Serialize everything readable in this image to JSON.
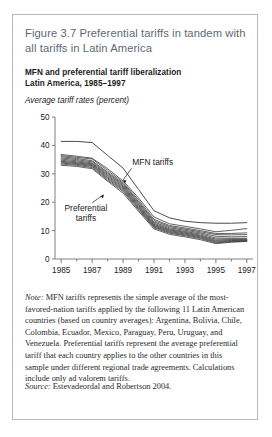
{
  "figure": {
    "number": "Figure 3.7",
    "title": "Preferential tariffs in tandem with all tariffs in Latin America",
    "subtitle_line1": "MFN and preferential tariff liberalization",
    "subtitle_line2": "Latin America, 1985–1997",
    "note_label": "Note:",
    "note_text": " MFN tariffs represents the simple average of the most-favored-nation tariffs applied by the following 11 Latin American countries (based on country averages): Argentina, Bolivia, Chile, Colombia, Ecuador, Mexico, Paraguay, Peru, Uruguay, and Venezuela. Preferential tariffs represent the average preferential tariff that each country applies to the other countries in this sample under different regional trade agreements. Calculations include only ad valorem tariffs.",
    "source_label": "Source:",
    "source_text": " Estevadeordal and Robertson 2004.",
    "border_color": "#b9b9b9",
    "title_color": "#5d6a72"
  },
  "chart_data": {
    "type": "line",
    "title": "MFN and preferential tariff liberalization Latin America, 1985–1997",
    "xlabel": "",
    "ylabel": "Average tariff rates (percent)",
    "ylabel_text": "Average tariff rates (percent)",
    "x": [
      1985,
      1986,
      1987,
      1988,
      1989,
      1990,
      1991,
      1992,
      1993,
      1994,
      1995,
      1996,
      1997
    ],
    "xlim": [
      1984.6,
      1997.4
    ],
    "ylim": [
      0,
      50
    ],
    "xticks": [
      1985,
      1986,
      1987,
      1988,
      1989,
      1990,
      1991,
      1992,
      1993,
      1994,
      1995,
      1996,
      1997
    ],
    "xticklabels": [
      "1985",
      "",
      "1987",
      "",
      "1989",
      "",
      "1991",
      "",
      "1993",
      "",
      "1995",
      "",
      "1997"
    ],
    "yticks": [
      0,
      10,
      20,
      30,
      40,
      50
    ],
    "yticklabels": [
      "0",
      "10",
      "20",
      "30",
      "40",
      "50"
    ],
    "grid": false,
    "legend": "annotations",
    "annotations": [
      {
        "text": "MFN tariffs",
        "x": 1989.6,
        "y": 33.0
      },
      {
        "text_line1": "Preferential",
        "text_line2": "tariffs",
        "x": 1986.6,
        "y": 17.0
      }
    ],
    "series": [
      {
        "name": "MFN tariffs",
        "group": "mfn",
        "values": [
          41.4,
          41.4,
          41.0,
          36.5,
          32.0,
          24.5,
          17.0,
          14.5,
          13.3,
          12.8,
          12.6,
          12.6,
          12.8
        ]
      },
      {
        "name": "Preferential tariff 1",
        "group": "preferential",
        "values": [
          36.8,
          36.2,
          35.5,
          31.8,
          27.5,
          21.5,
          14.8,
          12.4,
          11.5,
          10.6,
          9.6,
          10.1,
          10.7
        ]
      },
      {
        "name": "Preferential tariff 2",
        "group": "preferential",
        "values": [
          36.4,
          35.8,
          35.2,
          31.2,
          27.0,
          20.8,
          14.0,
          11.8,
          10.9,
          10.0,
          9.0,
          9.0,
          9.2
        ]
      },
      {
        "name": "Preferential tariff 3",
        "group": "preferential",
        "values": [
          36.0,
          35.4,
          34.6,
          30.6,
          26.6,
          20.2,
          13.5,
          11.4,
          10.5,
          9.6,
          8.6,
          8.5,
          8.6
        ]
      },
      {
        "name": "Preferential tariff 4",
        "group": "preferential",
        "values": [
          35.6,
          35.0,
          34.2,
          30.2,
          26.2,
          19.8,
          13.0,
          11.0,
          10.1,
          9.2,
          8.0,
          7.8,
          7.9
        ]
      },
      {
        "name": "Preferential tariff 5",
        "group": "preferential",
        "values": [
          35.2,
          34.6,
          33.8,
          29.8,
          25.8,
          19.3,
          12.6,
          10.6,
          9.7,
          8.8,
          7.4,
          7.3,
          7.3
        ]
      },
      {
        "name": "Preferential tariff 6",
        "group": "preferential",
        "values": [
          34.8,
          34.2,
          33.5,
          29.4,
          25.4,
          18.9,
          12.2,
          10.3,
          9.4,
          8.4,
          7.0,
          7.0,
          7.0
        ]
      },
      {
        "name": "Preferential tariff 7",
        "group": "preferential",
        "values": [
          34.4,
          33.9,
          33.2,
          29.0,
          25.0,
          18.5,
          11.9,
          10.0,
          9.1,
          8.1,
          6.6,
          6.8,
          6.8
        ]
      },
      {
        "name": "Preferential tariff 8",
        "group": "preferential",
        "values": [
          34.1,
          33.6,
          32.9,
          28.6,
          24.6,
          18.1,
          11.6,
          9.7,
          8.8,
          7.8,
          6.3,
          6.5,
          6.6
        ]
      },
      {
        "name": "Preferential tariff 9",
        "group": "preferential",
        "values": [
          33.8,
          33.3,
          32.6,
          28.2,
          24.2,
          17.7,
          11.3,
          9.4,
          8.5,
          7.5,
          6.0,
          6.3,
          6.4
        ]
      },
      {
        "name": "Preferential tariff 10",
        "group": "preferential",
        "values": [
          33.4,
          33.0,
          32.2,
          27.8,
          23.8,
          17.3,
          11.0,
          9.1,
          8.2,
          7.2,
          5.7,
          6.1,
          6.3
        ]
      },
      {
        "name": "Preferential tariff 11",
        "group": "preferential",
        "values": [
          33.0,
          32.6,
          31.8,
          27.4,
          23.2,
          16.8,
          10.6,
          8.7,
          7.8,
          6.8,
          5.4,
          5.9,
          6.2
        ]
      }
    ]
  }
}
